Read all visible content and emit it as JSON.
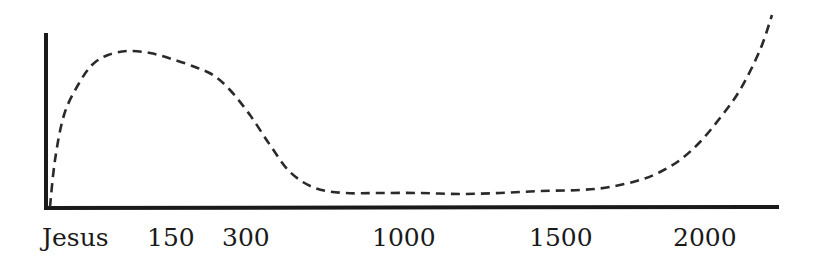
{
  "chart_data": {
    "type": "line",
    "title": "",
    "xlabel": "",
    "ylabel": "",
    "grid": false,
    "legend": null,
    "line_style": "dashed",
    "categories": [
      "Jesus",
      "150",
      "300",
      "1000",
      "1500",
      "2000"
    ],
    "x_tick_positions_px": [
      72,
      170,
      245,
      402,
      560,
      704
    ],
    "series": [
      {
        "name": "curve",
        "points_px": [
          [
            50,
            207
          ],
          [
            55,
            160
          ],
          [
            64,
            115
          ],
          [
            78,
            85
          ],
          [
            92,
            65
          ],
          [
            108,
            55
          ],
          [
            128,
            51
          ],
          [
            150,
            53
          ],
          [
            172,
            59
          ],
          [
            195,
            67
          ],
          [
            213,
            75
          ],
          [
            230,
            90
          ],
          [
            250,
            115
          ],
          [
            270,
            145
          ],
          [
            290,
            172
          ],
          [
            315,
            188
          ],
          [
            345,
            193
          ],
          [
            380,
            193
          ],
          [
            420,
            193
          ],
          [
            460,
            194
          ],
          [
            500,
            193
          ],
          [
            540,
            191
          ],
          [
            580,
            190
          ],
          [
            610,
            187
          ],
          [
            640,
            180
          ],
          [
            660,
            172
          ],
          [
            680,
            160
          ],
          [
            700,
            142
          ],
          [
            720,
            118
          ],
          [
            740,
            90
          ],
          [
            760,
            50
          ],
          [
            772,
            15
          ]
        ]
      }
    ],
    "axis_color": "#1a1a1a",
    "line_color": "#2a2a2a"
  },
  "axis": {
    "labels": [
      "Jesus",
      "150",
      "300",
      "1000",
      "1500",
      "2000"
    ]
  }
}
